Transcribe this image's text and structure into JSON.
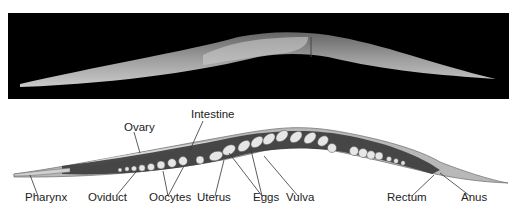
{
  "figure": {
    "photo_label": "micrograph",
    "labels": [
      {
        "id": "pharynx",
        "text": "Pharynx",
        "x": 25,
        "y": 197
      },
      {
        "id": "oviduct",
        "text": "Oviduct",
        "x": 88,
        "y": 197
      },
      {
        "id": "oocytes",
        "text": "Oocytes",
        "x": 149,
        "y": 197
      },
      {
        "id": "uterus",
        "text": "Uterus",
        "x": 197,
        "y": 197
      },
      {
        "id": "eggs",
        "text": "Eggs",
        "x": 253,
        "y": 197
      },
      {
        "id": "vulva",
        "text": "Vulva",
        "x": 286,
        "y": 197
      },
      {
        "id": "rectum",
        "text": "Rectum",
        "x": 387,
        "y": 197
      },
      {
        "id": "anus",
        "text": "Anus",
        "x": 461,
        "y": 197
      },
      {
        "id": "ovary",
        "text": "Ovary",
        "x": 124,
        "y": 126
      },
      {
        "id": "intestine",
        "text": "Intestine",
        "x": 191,
        "y": 113
      }
    ],
    "colors": {
      "photo_bg": "#000000",
      "body_fill": "#b8b8b8",
      "dark_tissue": "#3a3a3a",
      "light_cells": "#e6e6e6",
      "text": "#222222"
    }
  }
}
